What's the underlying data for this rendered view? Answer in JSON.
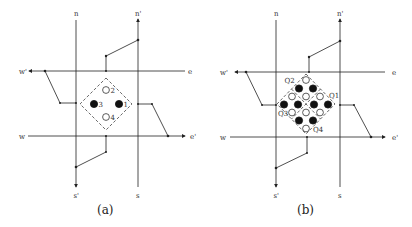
{
  "panels": [
    {
      "caption": "(a)",
      "road_labels": {
        "n": "n",
        "n_prime": "n'",
        "s": "s",
        "s_prime": "s'",
        "e": "e",
        "e_prime": "e'",
        "w": "w",
        "w_prime": "w'"
      },
      "circle_labels": [
        "1",
        "2",
        "3",
        "4"
      ],
      "circles": [
        {
          "label": "1",
          "state": "filled"
        },
        {
          "label": "2",
          "state": "open"
        },
        {
          "label": "3",
          "state": "filled"
        },
        {
          "label": "4",
          "state": "open"
        }
      ]
    },
    {
      "caption": "(b)",
      "road_labels": {
        "n": "n",
        "n_prime": "n'",
        "s": "s",
        "s_prime": "s'",
        "e": "e",
        "e_prime": "e'",
        "w": "w",
        "w_prime": "w'"
      },
      "quadrant_labels": [
        "Q1",
        "Q2",
        "Q3",
        "Q4"
      ],
      "circle_grid_summary": {
        "filled": 8,
        "open": 8
      }
    }
  ]
}
